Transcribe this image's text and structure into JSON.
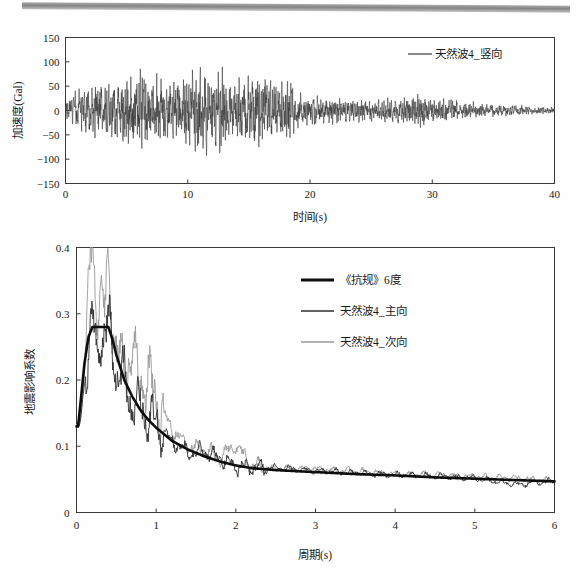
{
  "page": {
    "background_color": "#ffffff",
    "scan_artifact": "dark-scan-bar"
  },
  "figures": [
    {
      "id": "acceleration-time-history",
      "chart_data": {
        "type": "line",
        "title": "",
        "xlabel": "时间(s)",
        "ylabel": "加速度(Gal)",
        "xlim": [
          0,
          40
        ],
        "ylim": [
          -150,
          150
        ],
        "xticks": [
          0,
          10,
          20,
          30,
          40
        ],
        "yticks": [
          -150,
          -100,
          -50,
          0,
          50,
          100,
          150
        ],
        "xtick_labels": [
          "0",
          "10",
          "20",
          "30",
          "40"
        ],
        "ytick_labels": [
          "-150",
          "-100",
          "-50",
          "0",
          "50",
          "100",
          "150"
        ],
        "grid": false,
        "legend_position": "top-right",
        "legend": [
          "天然波4_竖向"
        ],
        "series": [
          {
            "name": "天然波4_竖向",
            "color": "#3b3b3b",
            "line_width": 0.6,
            "description": "vertical ground acceleration record, peak about 122 Gal near t=5.6 s and about -128 Gal near t=10.8 s, strong motion between 0 and 18 s, decaying tail after 20 s",
            "peak_positive": 122,
            "peak_negative": -128,
            "envelope": [
              {
                "t": 0,
                "amp": 22
              },
              {
                "t": 1,
                "amp": 52
              },
              {
                "t": 2,
                "amp": 70
              },
              {
                "t": 3,
                "amp": 78
              },
              {
                "t": 4,
                "amp": 72
              },
              {
                "t": 5,
                "amp": 95
              },
              {
                "t": 6,
                "amp": 122
              },
              {
                "t": 7,
                "amp": 86
              },
              {
                "t": 8,
                "amp": 90
              },
              {
                "t": 9,
                "amp": 88
              },
              {
                "t": 10,
                "amp": 100
              },
              {
                "t": 11,
                "amp": 128
              },
              {
                "t": 12,
                "amp": 105
              },
              {
                "t": 13,
                "amp": 96
              },
              {
                "t": 14,
                "amp": 80
              },
              {
                "t": 15,
                "amp": 84
              },
              {
                "t": 16,
                "amp": 102
              },
              {
                "t": 17,
                "amp": 74
              },
              {
                "t": 18,
                "amp": 92
              },
              {
                "t": 19,
                "amp": 48
              },
              {
                "t": 20,
                "amp": 38
              },
              {
                "t": 21,
                "amp": 34
              },
              {
                "t": 22,
                "amp": 36
              },
              {
                "t": 23,
                "amp": 32
              },
              {
                "t": 24,
                "amp": 30
              },
              {
                "t": 25,
                "amp": 28
              },
              {
                "t": 26,
                "amp": 30
              },
              {
                "t": 27,
                "amp": 32
              },
              {
                "t": 28,
                "amp": 36
              },
              {
                "t": 29,
                "amp": 44
              },
              {
                "t": 30,
                "amp": 30
              },
              {
                "t": 31,
                "amp": 34
              },
              {
                "t": 32,
                "amp": 24
              },
              {
                "t": 33,
                "amp": 22
              },
              {
                "t": 34,
                "amp": 18
              },
              {
                "t": 35,
                "amp": 16
              },
              {
                "t": 36,
                "amp": 15
              },
              {
                "t": 37,
                "amp": 14
              },
              {
                "t": 38,
                "amp": 12
              },
              {
                "t": 39,
                "amp": 10
              },
              {
                "t": 40,
                "amp": 8
              }
            ]
          }
        ]
      }
    },
    {
      "id": "response-spectrum",
      "chart_data": {
        "type": "line",
        "title": "",
        "xlabel": "周期(s)",
        "ylabel": "地震影响系数",
        "xlim": [
          0,
          6
        ],
        "ylim": [
          0,
          0.4
        ],
        "xticks": [
          0,
          1,
          2,
          3,
          4,
          5,
          6
        ],
        "yticks": [
          0,
          0.1,
          0.2,
          0.3,
          0.4
        ],
        "xtick_labels": [
          "0",
          "1",
          "2",
          "3",
          "4",
          "5",
          "6"
        ],
        "ytick_labels": [
          "0",
          "0.1",
          "0.2",
          "0.3",
          "0.4"
        ],
        "grid": false,
        "legend_position": "upper-right",
        "legend": [
          "《抗规》6度",
          "天然波4_主向",
          "天然波4_次向"
        ],
        "x": [
          0.02,
          0.05,
          0.1,
          0.15,
          0.2,
          0.25,
          0.3,
          0.35,
          0.4,
          0.45,
          0.5,
          0.6,
          0.7,
          0.8,
          0.9,
          1.0,
          1.2,
          1.4,
          1.6,
          1.8,
          2.0,
          2.2,
          2.5,
          3.0,
          3.5,
          4.0,
          4.5,
          5.0,
          5.5,
          6.0
        ],
        "series": [
          {
            "name": "《抗规》6度",
            "color": "#0d0d0d",
            "line_width": 2.6,
            "values": [
              0.13,
              0.165,
              0.225,
              0.265,
              0.28,
              0.28,
              0.28,
              0.28,
              0.28,
              0.262,
              0.238,
              0.2,
              0.175,
              0.155,
              0.14,
              0.128,
              0.108,
              0.095,
              0.085,
              0.077,
              0.071,
              0.067,
              0.064,
              0.061,
              0.058,
              0.056,
              0.053,
              0.051,
              0.049,
              0.047
            ]
          },
          {
            "name": "天然波4_主向",
            "color": "#2e2e2e",
            "line_width": 0.9,
            "values": [
              0.13,
              0.135,
              0.2,
              0.235,
              0.29,
              0.245,
              0.272,
              0.255,
              0.288,
              0.25,
              0.215,
              0.2,
              0.165,
              0.158,
              0.145,
              0.13,
              0.108,
              0.09,
              0.092,
              0.082,
              0.07,
              0.067,
              0.068,
              0.063,
              0.06,
              0.057,
              0.055,
              0.052,
              0.042,
              0.048
            ]
          },
          {
            "name": "天然波4_次向",
            "color": "#9a9a9a",
            "line_width": 0.9,
            "values": [
              0.13,
              0.14,
              0.22,
              0.345,
              0.4,
              0.3,
              0.355,
              0.3,
              0.36,
              0.29,
              0.255,
              0.205,
              0.245,
              0.195,
              0.205,
              0.17,
              0.125,
              0.1,
              0.095,
              0.082,
              0.102,
              0.07,
              0.066,
              0.066,
              0.063,
              0.058,
              0.057,
              0.054,
              0.052,
              0.048
            ]
          }
        ]
      }
    }
  ]
}
